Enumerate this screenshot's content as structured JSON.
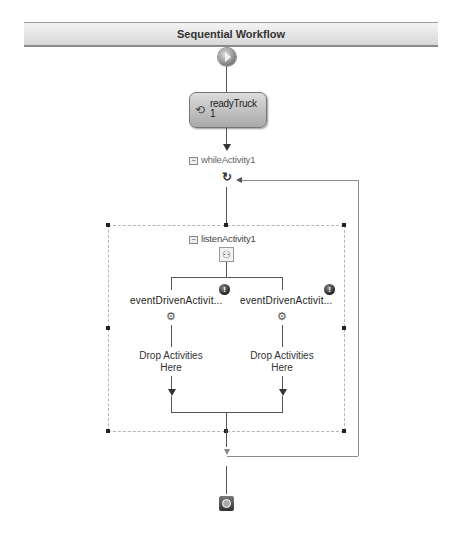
{
  "header": {
    "title": "Sequential Workflow"
  },
  "workflow": {
    "start": {
      "icon": "start-icon"
    },
    "activity": {
      "name": "readyTruck1",
      "label_line1": "readyTruck",
      "label_line2": "1",
      "icon": "code-activity-icon"
    },
    "while_activity": {
      "label": "whileActivity1",
      "collapse_glyph": "−",
      "icon": "loop-icon"
    },
    "listen_activity": {
      "label": "listenActivity1",
      "collapse_glyph": "−",
      "icon": "listen-icon",
      "branches": [
        {
          "label": "eventDrivenActivit...",
          "icon": "event-driven-icon",
          "warning_icon": "!",
          "drop_text_line1": "Drop Activities",
          "drop_text_line2": "Here"
        },
        {
          "label": "eventDrivenActivit...",
          "icon": "event-driven-icon",
          "warning_icon": "!",
          "drop_text_line1": "Drop Activities",
          "drop_text_line2": "Here"
        }
      ]
    },
    "end": {
      "icon": "end-icon"
    }
  },
  "colors": {
    "line": "#555555",
    "selection_border": "#b5b5b5",
    "header_bg": "#e2e2e2"
  }
}
